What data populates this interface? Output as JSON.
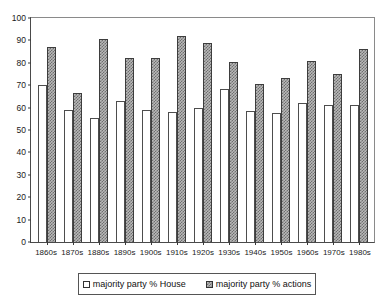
{
  "chart_data": {
    "type": "bar",
    "title": "",
    "subtitle": "",
    "xlabel": "",
    "ylabel": "",
    "ylim": [
      0,
      100
    ],
    "ytick_step": 10,
    "yticks": [
      100,
      90,
      80,
      70,
      60,
      50,
      40,
      30,
      20,
      10,
      0
    ],
    "grid": false,
    "legend_position": "bottom",
    "categories": [
      "1860s",
      "1870s",
      "1880s",
      "1890s",
      "1900s",
      "1910s",
      "1920s",
      "1930s",
      "1940s",
      "1950s",
      "1960s",
      "1970s",
      "1980s"
    ],
    "series": [
      {
        "name": "majority party % House",
        "fill": "white",
        "values": [
          70,
          59,
          55.5,
          63,
          59,
          58,
          60,
          68.5,
          58.5,
          57.5,
          62,
          61,
          61
        ]
      },
      {
        "name": "majority party % actions",
        "fill": "hatched",
        "values": [
          87,
          66.5,
          90.5,
          82,
          82,
          92,
          89,
          80.5,
          70.5,
          73,
          81,
          75,
          86
        ]
      }
    ]
  },
  "legend": {
    "items": [
      {
        "label": "majority party % House",
        "swatch": "white-square-swatch"
      },
      {
        "label": "majority party % actions",
        "swatch": "hatched-square-swatch"
      }
    ]
  },
  "colors": {
    "axis": "#4a4a4a",
    "bar_house_fill": "#ffffff",
    "bar_house_border": "#4d4d4d",
    "bar_actions_fill": "#b9b9b9",
    "bar_actions_hatch": "#6e6e6e",
    "text": "#111111",
    "background": "#ffffff"
  }
}
